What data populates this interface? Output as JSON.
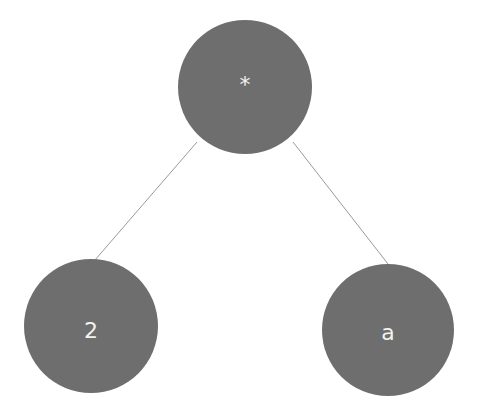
{
  "diagram": {
    "type": "expression-tree",
    "node_color": "#6e6e6e",
    "edge_color": "#9a9a9a",
    "label_color": "#f2f2f2",
    "nodes": [
      {
        "id": "root",
        "label": "*",
        "cx": 245,
        "cy": 87,
        "r": 67
      },
      {
        "id": "left",
        "label": "2",
        "cx": 91,
        "cy": 326,
        "r": 67
      },
      {
        "id": "right",
        "label": "a",
        "cx": 388,
        "cy": 330,
        "r": 66
      }
    ],
    "edges": [
      {
        "from": "root",
        "to": "left"
      },
      {
        "from": "root",
        "to": "right"
      }
    ]
  }
}
